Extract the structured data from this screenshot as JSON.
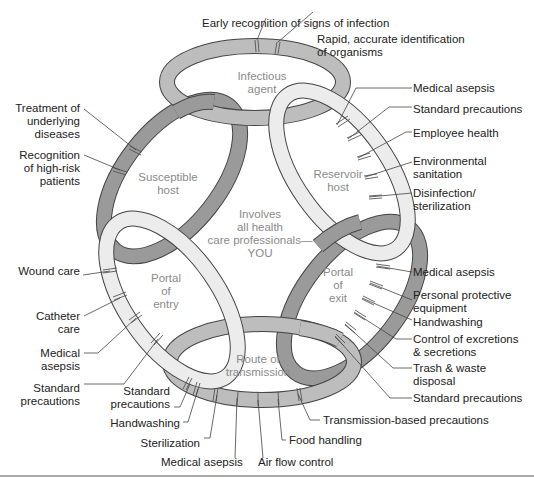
{
  "colors": {
    "dark_ring": "#9a9a9a",
    "medium_ring": "#bdbdbd",
    "light_ring": "#ececec",
    "outline": "#444444",
    "inner_text": "#8a8a8a",
    "label_text": "#222222"
  },
  "center": {
    "text_lines": [
      "Involves",
      "all health",
      "care professionals—",
      "YOU"
    ]
  },
  "links": [
    {
      "id": "infectious-agent",
      "lines": [
        "Infectious",
        "agent"
      ],
      "shade": "medium"
    },
    {
      "id": "reservoir-host",
      "lines": [
        "Reservoir",
        "host"
      ],
      "shade": "light"
    },
    {
      "id": "portal-of-exit",
      "lines": [
        "Portal",
        "of",
        "exit"
      ],
      "shade": "dark"
    },
    {
      "id": "route-of-transmission",
      "lines": [
        "Route of",
        "transmission"
      ],
      "shade": "medium"
    },
    {
      "id": "portal-of-entry",
      "lines": [
        "Portal",
        "of",
        "entry"
      ],
      "shade": "light"
    },
    {
      "id": "susceptible-host",
      "lines": [
        "Susceptible",
        "host"
      ],
      "shade": "dark"
    }
  ],
  "labels": {
    "infectious_agent": [
      "Early recognition of signs of infection",
      "Rapid, accurate identification\nof organisms"
    ],
    "reservoir_host": [
      "Medical asepsis",
      "Standard precautions",
      "Employee health",
      "Environmental\nsanitation",
      "Disinfection/\nsterilization"
    ],
    "portal_of_exit": [
      "Medical asepsis",
      "Personal protective\nequipment",
      "Handwashing",
      "Control of excretions\n& secretions",
      "Trash & waste\ndisposal",
      "Standard precautions"
    ],
    "route_of_transmission": [
      "Transmission-based precautions",
      "Food handling",
      "Air flow control",
      "Medical asepsis",
      "Sterilization",
      "Handwashing",
      "Standard\nprecautions"
    ],
    "portal_of_entry": [
      "Wound care",
      "Catheter\ncare",
      "Medical\nasepsis",
      "Standard\nprecautions"
    ],
    "susceptible_host": [
      "Treatment of\nunderlying\ndiseases",
      "Recognition\nof high-risk\npatients"
    ]
  },
  "label_text": {
    "a0": "Early recognition of signs of infection",
    "a1a": "Rapid, accurate identification",
    "a1b": "of organisms",
    "r0": "Medical asepsis",
    "r1": "Standard precautions",
    "r2": "Employee health",
    "r3a": "Environmental",
    "r3b": "sanitation",
    "r4a": "Disinfection/",
    "r4b": "sterilization",
    "x0": "Medical asepsis",
    "x1a": "Personal protective",
    "x1b": "equipment",
    "x2": "Handwashing",
    "x3a": "Control of excretions",
    "x3b": "& secretions",
    "x4a": "Trash & waste",
    "x4b": "disposal",
    "x5": "Standard precautions",
    "t0": "Transmission-based precautions",
    "t1": "Food handling",
    "t2": "Air flow control",
    "t3": "Medical asepsis",
    "t4": "Sterilization",
    "t5": "Handwashing",
    "t6a": "Standard",
    "t6b": "precautions",
    "e0": "Wound care",
    "e1a": "Catheter",
    "e1b": "care",
    "e2a": "Medical",
    "e2b": "asepsis",
    "e3a": "Standard",
    "e3b": "precautions",
    "s0a": "Treatment of",
    "s0b": "underlying",
    "s0c": "diseases",
    "s1a": "Recognition",
    "s1b": "of high-risk",
    "s1c": "patients"
  }
}
